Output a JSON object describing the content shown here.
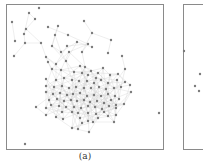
{
  "figure": {
    "panels": [
      {
        "id": "a",
        "caption": "(a)",
        "type": "network-graph",
        "node_color": "#7a7a7a",
        "edge_color": "#d4d4d4",
        "nodes": [
          [
            39,
            8
          ],
          [
            29,
            13
          ],
          [
            35,
            19
          ],
          [
            12,
            22
          ],
          [
            84,
            21
          ],
          [
            48,
            27
          ],
          [
            58,
            26
          ],
          [
            26,
            29
          ],
          [
            24,
            34
          ],
          [
            15,
            41
          ],
          [
            25,
            43
          ],
          [
            41,
            43
          ],
          [
            55,
            35
          ],
          [
            68,
            35
          ],
          [
            92,
            33
          ],
          [
            77,
            42
          ],
          [
            111,
            40
          ],
          [
            14,
            56
          ],
          [
            52,
            46
          ],
          [
            67,
            46
          ],
          [
            88,
            44
          ],
          [
            92,
            47
          ],
          [
            82,
            52
          ],
          [
            108,
            53
          ],
          [
            122,
            56
          ],
          [
            46,
            57
          ],
          [
            48,
            62
          ],
          [
            61,
            52
          ],
          [
            69,
            52
          ],
          [
            56,
            64
          ],
          [
            66,
            61
          ],
          [
            80,
            66
          ],
          [
            85,
            67
          ],
          [
            91,
            71
          ],
          [
            98,
            73
          ],
          [
            103,
            68
          ],
          [
            125,
            69
          ],
          [
            52,
            69
          ],
          [
            61,
            70
          ],
          [
            74,
            72
          ],
          [
            82,
            73
          ],
          [
            88,
            75
          ],
          [
            96,
            78
          ],
          [
            110,
            75
          ],
          [
            118,
            74
          ],
          [
            46,
            79
          ],
          [
            56,
            80
          ],
          [
            64,
            78
          ],
          [
            72,
            80
          ],
          [
            79,
            81
          ],
          [
            87,
            81
          ],
          [
            94,
            83
          ],
          [
            101,
            80
          ],
          [
            108,
            83
          ],
          [
            117,
            80
          ],
          [
            125,
            82
          ],
          [
            46,
            86
          ],
          [
            54,
            87
          ],
          [
            62,
            86
          ],
          [
            69,
            88
          ],
          [
            76,
            87
          ],
          [
            84,
            88
          ],
          [
            91,
            88
          ],
          [
            99,
            87
          ],
          [
            106,
            89
          ],
          [
            114,
            88
          ],
          [
            121,
            87
          ],
          [
            130,
            85
          ],
          [
            46,
            92
          ],
          [
            53,
            94
          ],
          [
            60,
            93
          ],
          [
            67,
            95
          ],
          [
            73,
            94
          ],
          [
            80,
            93
          ],
          [
            87,
            96
          ],
          [
            94,
            95
          ],
          [
            101,
            96
          ],
          [
            108,
            94
          ],
          [
            115,
            96
          ],
          [
            131,
            92
          ],
          [
            49,
            100
          ],
          [
            57,
            99
          ],
          [
            64,
            101
          ],
          [
            71,
            100
          ],
          [
            77,
            101
          ],
          [
            84,
            100
          ],
          [
            90,
            102
          ],
          [
            97,
            101
          ],
          [
            104,
            103
          ],
          [
            111,
            100
          ],
          [
            119,
            99
          ],
          [
            51,
            105
          ],
          [
            59,
            106
          ],
          [
            66,
            107
          ],
          [
            74,
            107
          ],
          [
            81,
            108
          ],
          [
            88,
            106
          ],
          [
            95,
            107
          ],
          [
            102,
            109
          ],
          [
            109,
            106
          ],
          [
            116,
            105
          ],
          [
            124,
            104
          ],
          [
            36,
            107
          ],
          [
            46,
            108
          ],
          [
            62,
            112
          ],
          [
            72,
            112
          ],
          [
            78,
            113
          ],
          [
            88,
            113
          ],
          [
            96,
            114
          ],
          [
            104,
            112
          ],
          [
            116,
            108
          ],
          [
            46,
            115
          ],
          [
            56,
            117
          ],
          [
            63,
            119
          ],
          [
            80,
            118
          ],
          [
            88,
            121
          ],
          [
            98,
            118
          ],
          [
            108,
            116
          ],
          [
            116,
            115
          ],
          [
            114,
            122
          ],
          [
            82,
            123
          ],
          [
            93,
            122
          ],
          [
            72,
            128
          ],
          [
            78,
            129
          ],
          [
            89,
            132
          ],
          [
            159,
            113
          ],
          [
            25,
            144
          ]
        ]
      },
      {
        "id": "b",
        "caption": "",
        "type": "network-graph",
        "node_color": "#7a7a7a",
        "nodes": [
          [
            184,
            51
          ],
          [
            200,
            74
          ],
          [
            195,
            86
          ],
          [
            199,
            91
          ]
        ]
      }
    ]
  }
}
